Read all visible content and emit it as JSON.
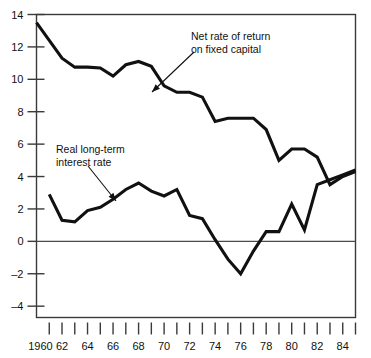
{
  "chart_data": {
    "type": "line",
    "title": "",
    "subtitle": "",
    "xlabel": "",
    "ylabel": "",
    "xlim": [
      1960,
      1985
    ],
    "ylim": [
      -4.7,
      14
    ],
    "grid": false,
    "legend_position": "inline-annotations",
    "y_ticks": [
      14,
      12,
      10,
      8,
      6,
      4,
      2,
      0,
      -2,
      -4
    ],
    "y_tick_labels": [
      "14",
      "12",
      "10",
      "8",
      "6",
      "4",
      "2",
      "0",
      "–2",
      "–4"
    ],
    "x_ticks": [
      1960,
      1961,
      1962,
      1963,
      1964,
      1965,
      1966,
      1967,
      1968,
      1969,
      1970,
      1971,
      1972,
      1973,
      1974,
      1975,
      1976,
      1977,
      1978,
      1979,
      1980,
      1981,
      1982,
      1983,
      1984,
      1985
    ],
    "x_tick_labels": [
      "1960",
      "",
      "62",
      "",
      "64",
      "",
      "66",
      "",
      "68",
      "",
      "70",
      "",
      "72",
      "",
      "74",
      "",
      "76",
      "",
      "78",
      "",
      "80",
      "",
      "82",
      "",
      "84",
      ""
    ],
    "zero_line": 0,
    "series": [
      {
        "name": "Net rate of return on fixed capital",
        "x": [
          1960,
          1961,
          1962,
          1963,
          1964,
          1965,
          1966,
          1967,
          1968,
          1969,
          1970,
          1971,
          1972,
          1973,
          1974,
          1975,
          1976,
          1977,
          1978,
          1979,
          1980,
          1981,
          1982,
          1983,
          1984,
          1985
        ],
        "values": [
          13.5,
          12.4,
          11.3,
          10.75,
          10.75,
          10.7,
          10.2,
          10.9,
          11.1,
          10.8,
          9.6,
          9.2,
          9.2,
          8.9,
          7.4,
          7.6,
          7.6,
          7.6,
          6.9,
          5.0,
          5.7,
          5.7,
          5.2,
          3.5,
          4.0,
          4.3
        ]
      },
      {
        "name": "Real long-term interest rate",
        "x": [
          1961,
          1962,
          1963,
          1964,
          1965,
          1966,
          1967,
          1968,
          1969,
          1970,
          1971,
          1972,
          1973,
          1974,
          1975,
          1976,
          1977,
          1978,
          1979,
          1980,
          1981,
          1982,
          1983,
          1984,
          1985
        ],
        "values": [
          2.9,
          1.3,
          1.2,
          1.9,
          2.1,
          2.6,
          3.2,
          3.6,
          3.1,
          2.8,
          3.2,
          1.6,
          1.4,
          0.1,
          -1.1,
          -2.0,
          -0.6,
          0.6,
          0.6,
          2.3,
          0.7,
          3.5,
          3.8,
          4.1,
          4.4
        ]
      }
    ],
    "annotations": [
      {
        "id": "net-rate-label",
        "text_lines": [
          "Net rate of return",
          "on fixed capital"
        ],
        "points_to_series": "Net rate of return on fixed capital",
        "points_to_x": 1973,
        "points_to_y": 8.9
      },
      {
        "id": "real-rate-label",
        "text_lines": [
          "Real long-term",
          "interest rate"
        ],
        "points_to_series": "Real long-term interest rate",
        "points_to_x": 1965,
        "points_to_y": 2.1
      }
    ],
    "colors": {
      "series_line": "#111111",
      "axis": "#3a3a3a",
      "text": "#111111",
      "background": "#ffffff"
    }
  }
}
